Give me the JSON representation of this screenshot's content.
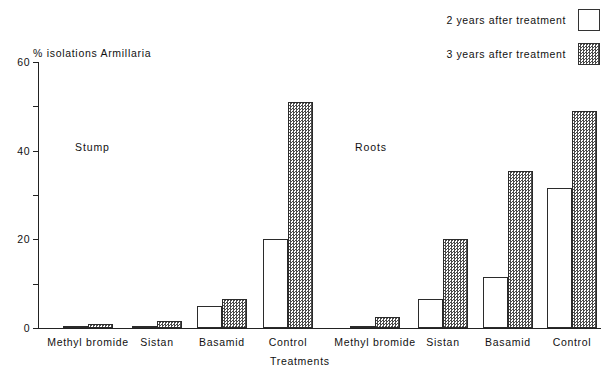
{
  "chart_data": {
    "type": "bar",
    "title": "",
    "ylabel": "% isolations Armillaria",
    "xlabel": "Treatments",
    "ylim": [
      0,
      60
    ],
    "yticks": [
      0,
      20,
      40,
      60
    ],
    "yminorticks": [
      10,
      30,
      50
    ],
    "grid": false,
    "legend_position": "top-right",
    "categories": [
      "Methyl bromide",
      "Sistan",
      "Basamid",
      "Control",
      "Methyl bromide",
      "Sistan",
      "Basamid",
      "Control"
    ],
    "groups": [
      {
        "name": "Stump",
        "categories": [
          "Methyl bromide",
          "Sistan",
          "Basamid",
          "Control"
        ]
      },
      {
        "name": "Roots",
        "categories": [
          "Methyl bromide",
          "Sistan",
          "Basamid",
          "Control"
        ]
      }
    ],
    "series": [
      {
        "name": "2 years after treatment",
        "fill": "white",
        "values": [
          0.5,
          0.5,
          5.0,
          20.0,
          0.5,
          6.5,
          11.5,
          31.5
        ]
      },
      {
        "name": "3 years after treatment",
        "fill": "hatched",
        "values": [
          1.0,
          1.5,
          6.5,
          51.0,
          2.5,
          20.0,
          35.5,
          49.0
        ]
      }
    ]
  },
  "axis": {
    "y_title": "% isolations Armillaria",
    "x_title": "Treatments",
    "y_tick_labels": [
      "60",
      "40",
      "20",
      "0"
    ]
  },
  "legend": {
    "entries": [
      {
        "label": "2 years after treatment",
        "swatch": "white-square-icon"
      },
      {
        "label": "3 years after treatment",
        "swatch": "hatched-square-icon"
      }
    ]
  },
  "groups": {
    "stump_label": "Stump",
    "roots_label": "Roots"
  },
  "category_labels": [
    "Methyl bromide",
    "Sistan",
    "Basamid",
    "Control",
    "Methyl bromide",
    "Sistan",
    "Basamid",
    "Control"
  ]
}
